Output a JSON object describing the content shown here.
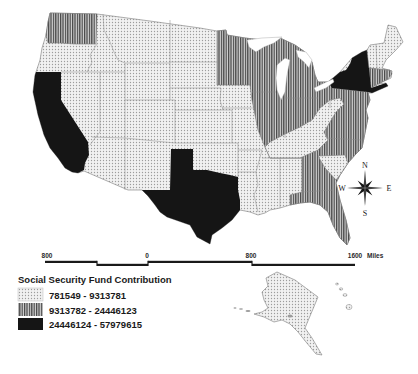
{
  "legend": {
    "title": "Social Security Fund Contribution",
    "classes": [
      {
        "label": "781549 - 9313781",
        "min": 781549,
        "max": 9313781,
        "pattern": "light-dotted",
        "fill_color": "#eeeeee"
      },
      {
        "label": "9313782 - 24446123",
        "min": 9313782,
        "max": 24446123,
        "pattern": "vertical-stripes",
        "fill_color": "#7a7a7a"
      },
      {
        "label": "24446124 - 57979615",
        "min": 24446124,
        "max": 57979615,
        "pattern": "solid-black",
        "fill_color": "#151515"
      }
    ]
  },
  "scale_bar": {
    "labels": [
      "800",
      "0",
      "800",
      "1600"
    ],
    "unit": "Miles"
  },
  "compass": {
    "north": "N",
    "south": "S",
    "east": "E",
    "west": "W"
  },
  "map_data": {
    "type": "choropleth",
    "extent": "United States (lower 48 with Alaska and Hawaii insets)",
    "class_1_light_dotted": [
      "lower-48 states not listed below",
      "AK",
      "HI"
    ],
    "class_2_vertical_stripes": [
      "WA",
      "MN",
      "WI",
      "MI",
      "IL",
      "IN",
      "OH",
      "PA",
      "NJ",
      "MD",
      "DE",
      "VA",
      "NC",
      "GA",
      "FL",
      "MA",
      "CT"
    ],
    "class_3_solid_black": [
      "CA",
      "TX",
      "NY"
    ]
  }
}
